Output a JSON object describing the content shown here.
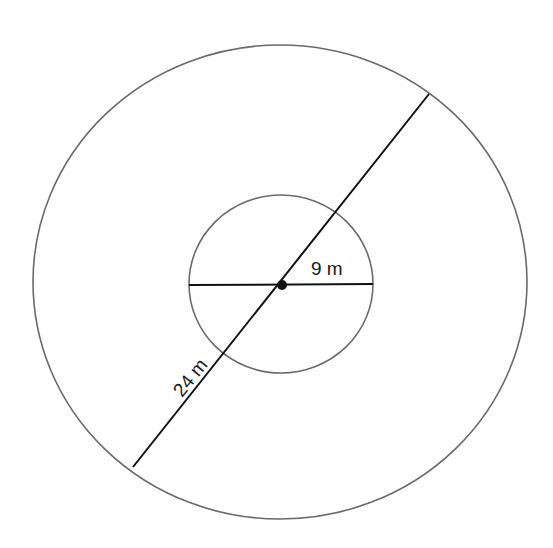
{
  "diagram": {
    "type": "concentric-circles",
    "outer_circle": {
      "label": "24 m",
      "measure": "diameter"
    },
    "inner_circle": {
      "label": "9 m",
      "measure": "radius"
    },
    "colors": {
      "circle_stroke": "#6a6a6a",
      "line_stroke": "#111111",
      "background": "#ffffff"
    }
  }
}
